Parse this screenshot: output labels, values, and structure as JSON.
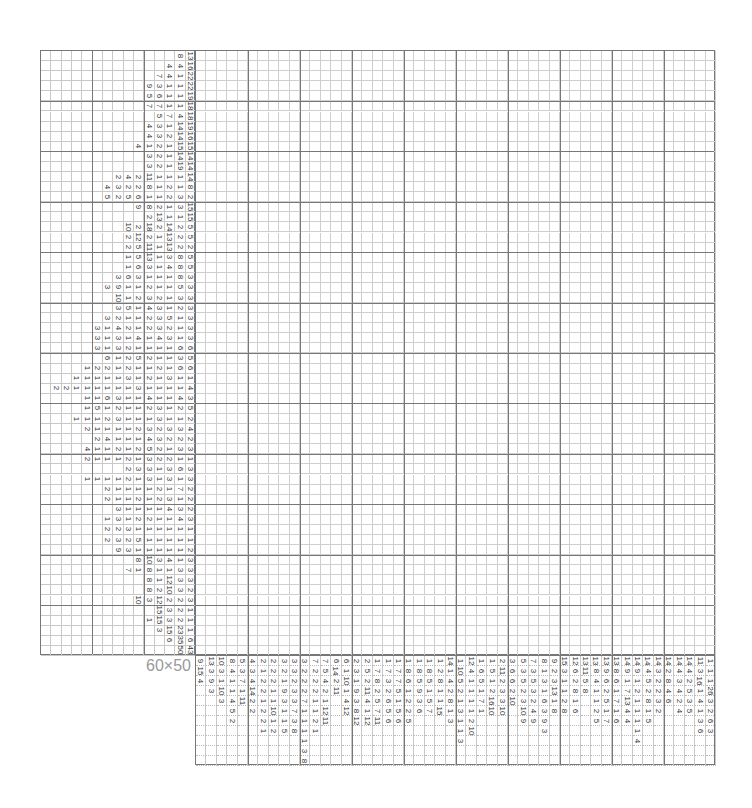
{
  "puzzle": {
    "size_label": "60×50",
    "rows": 60,
    "cols": 50,
    "row_clue_slots": 15,
    "col_clue_slots": 11,
    "thick_every": 5,
    "line_color": "#777777",
    "thin_line_color": "#cfcfcf"
  },
  "row_clues": [
    [
      "8",
      "13"
    ],
    [
      "4",
      "4",
      "16"
    ],
    [
      "7",
      "4",
      "1",
      "22"
    ],
    [
      "9",
      "3",
      "1",
      "1",
      "22"
    ],
    [
      "5",
      "6",
      "1",
      "1",
      "19"
    ],
    [
      "7",
      "7",
      "1",
      "1",
      "18"
    ],
    [
      "5",
      "7",
      "4",
      "18"
    ],
    [
      "4",
      "3",
      "1",
      "14",
      "19"
    ],
    [
      "4",
      "3",
      "2",
      "14",
      "16"
    ],
    [
      "4",
      "1",
      "2",
      "1",
      "15",
      "15"
    ],
    [
      "3",
      "2",
      "1",
      "14",
      "14"
    ],
    [
      "3",
      "2",
      "1",
      "19",
      "14"
    ],
    [
      "2",
      "4",
      "2",
      "11",
      "1",
      "1",
      "1",
      "14"
    ],
    [
      "4",
      "3",
      "2",
      "2",
      "8",
      "1",
      "2",
      "1",
      "8"
    ],
    [
      "5",
      "2",
      "5",
      "6",
      "1",
      "1",
      "2",
      "3",
      "2"
    ],
    [
      "9",
      "8",
      "2",
      "1",
      "3",
      "15"
    ],
    [
      "2",
      "13",
      "1",
      "1",
      "15"
    ],
    [
      "10",
      "2",
      "18",
      "2",
      "14",
      "2",
      "5"
    ],
    [
      "2",
      "12",
      "2",
      "1",
      "13",
      "2",
      "5"
    ],
    [
      "2",
      "5",
      "11",
      "1",
      "13",
      "2",
      "2"
    ],
    [
      "1",
      "5",
      "13",
      "1",
      "3",
      "8",
      "5"
    ],
    [
      "1",
      "6",
      "3",
      "1",
      "4",
      "8",
      "5"
    ],
    [
      "3",
      "6",
      "3",
      "1",
      "1",
      "1",
      "8",
      "3"
    ],
    [
      "3",
      "9",
      "1",
      "1",
      "2",
      "1",
      "1",
      "5",
      "3"
    ],
    [
      "10",
      "1",
      "2",
      "3",
      "2",
      "1",
      "3",
      "3"
    ],
    [
      "3",
      "5",
      "1",
      "4",
      "3",
      "1",
      "2",
      "3"
    ],
    [
      "3",
      "2",
      "1",
      "1",
      "2",
      "3",
      "5",
      "1",
      "3"
    ],
    [
      "3",
      "1",
      "4",
      "2",
      "1",
      "2",
      "3",
      "2",
      "1",
      "3"
    ],
    [
      "3",
      "1",
      "3",
      "1",
      "4",
      "1",
      "4",
      "3",
      "1",
      "3"
    ],
    [
      "3",
      "1",
      "3",
      "2",
      "1",
      "1",
      "1",
      "1",
      "6",
      "6"
    ],
    [
      "6",
      "1",
      "2",
      "5",
      "2",
      "1",
      "1",
      "3",
      "5"
    ],
    [
      "1",
      "2",
      "2",
      "1",
      "2",
      "1",
      "1",
      "2",
      "1",
      "6",
      "6"
    ],
    [
      "1",
      "1",
      "1",
      "1",
      "1",
      "3",
      "1",
      "2",
      "1",
      "3",
      "1",
      "1"
    ],
    [
      "2",
      "2",
      "1",
      "1",
      "1",
      "1",
      "1",
      "1",
      "3",
      "1",
      "1",
      "1",
      "1",
      "4"
    ],
    [
      "1",
      "1",
      "6",
      "3",
      "1",
      "1",
      "4",
      "1",
      "1",
      "4",
      "3"
    ],
    [
      "1",
      "5",
      "1",
      "2",
      "1",
      "1",
      "2",
      "3",
      "1",
      "2",
      "5"
    ],
    [
      "1",
      "1",
      "1",
      "2",
      "3",
      "1",
      "1",
      "1",
      "3",
      "1",
      "1",
      "2"
    ],
    [
      "2",
      "1",
      "1",
      "1",
      "1",
      "2",
      "3",
      "2",
      "3",
      "3",
      "4"
    ],
    [
      "2",
      "4",
      "1",
      "1",
      "1",
      "4",
      "3",
      "2",
      "2",
      "2"
    ],
    [
      "4",
      "1",
      "1",
      "2",
      "1",
      "2",
      "5",
      "2",
      "1",
      "3",
      "3"
    ],
    [
      "2",
      "1",
      "1",
      "1",
      "2",
      "1",
      "3",
      "2",
      "2",
      "1",
      "1"
    ],
    [
      "2",
      "3",
      "3",
      "1",
      "3",
      "6",
      "3"
    ],
    [
      "1",
      "1",
      "1",
      "1",
      "2",
      "1",
      "3",
      "1",
      "3",
      "1",
      "3"
    ],
    [
      "2",
      "1",
      "1",
      "1",
      "1",
      "2",
      "1",
      "7",
      "2"
    ],
    [
      "2",
      "1",
      "1",
      "2",
      "1",
      "2",
      "3",
      "1",
      "2"
    ],
    [
      "3",
      "1",
      "1",
      "1",
      "1",
      "4",
      "3",
      "2"
    ],
    [
      "1",
      "3",
      "1",
      "2",
      "2",
      "1",
      "1",
      "4",
      "3"
    ],
    [
      "2",
      "2",
      "3",
      "1",
      "1",
      "1",
      "1",
      "1",
      "1"
    ],
    [
      "2",
      "3",
      "2",
      "5",
      "1",
      "1",
      "1",
      "1",
      "1"
    ],
    [
      "9",
      "3",
      "1",
      "1",
      "1",
      "1",
      "1",
      "2"
    ],
    [
      "8",
      "10",
      "3",
      "4",
      "1",
      "3"
    ],
    [
      "7",
      "1",
      "8",
      "1",
      "1",
      "3",
      "3"
    ],
    [
      "8",
      "1",
      "12",
      "3",
      "3"
    ],
    [
      "8",
      "2",
      "10",
      "3",
      "2"
    ],
    [
      "10",
      "3",
      "12",
      "2",
      "2",
      "3"
    ],
    [
      "15",
      "3",
      "2",
      "1"
    ],
    [
      "1",
      "15",
      "3",
      "2",
      "1"
    ],
    [
      "3",
      "15",
      "23",
      "1"
    ],
    [
      "6",
      "35",
      "6"
    ],
    [
      "50",
      "43"
    ]
  ],
  "col_clues": [
    [
      "9",
      "15",
      "4"
    ],
    [
      "13",
      "3",
      "9",
      "3"
    ],
    [
      "10",
      "3",
      "1",
      "10",
      "3"
    ],
    [
      "8",
      "4",
      "1",
      "1",
      "4",
      "5",
      "2"
    ],
    [
      "5",
      "3",
      "7",
      "1",
      "11"
    ],
    [
      "4",
      "3",
      "4",
      "14",
      "2",
      "2"
    ],
    [
      "2",
      "1",
      "2",
      "2",
      "1",
      "2",
      "2",
      "1"
    ],
    [
      "2",
      "2",
      "2",
      "1",
      "1",
      "10",
      "1",
      "2"
    ],
    [
      "3",
      "2",
      "1",
      "9",
      "3",
      "1",
      "1",
      "5"
    ],
    [
      "3",
      "3",
      "2",
      "3",
      "3",
      "7",
      "3",
      "8"
    ],
    [
      "3",
      "2",
      "2",
      "2",
      "7",
      "1",
      "1",
      "1",
      "1",
      "3",
      "8"
    ],
    [
      "7",
      "2",
      "2",
      "2",
      "1",
      "1",
      "2",
      "1"
    ],
    [
      "7",
      "5",
      "4",
      "2",
      "1",
      "12",
      "11"
    ],
    [
      "6",
      "14",
      "2",
      "11"
    ],
    [
      "6",
      "1",
      "10",
      "1",
      "4",
      "12"
    ],
    [
      "2",
      "3",
      "1",
      "9",
      "3",
      "8",
      "12"
    ],
    [
      "2",
      "5",
      "2",
      "11",
      "4",
      "1",
      "12"
    ],
    [
      "1",
      "7",
      "8",
      "2",
      "5",
      "7",
      "11"
    ],
    [
      "1",
      "7",
      "3",
      "2",
      "6",
      "5",
      "6"
    ],
    [
      "1",
      "7",
      "7",
      "5",
      "1",
      "5",
      "6"
    ],
    [
      "1",
      "8",
      "6",
      "1",
      "2",
      "2",
      "5"
    ],
    [
      "1",
      "8",
      "5",
      "9",
      "3",
      "6"
    ],
    [
      "1",
      "8",
      "5",
      "1",
      "5",
      "7"
    ],
    [
      "1",
      "2",
      "8",
      "1",
      "1",
      "15"
    ],
    [
      "14",
      "1",
      "4",
      "2",
      "8",
      "1",
      "3"
    ],
    [
      "1",
      "10",
      "5",
      "2",
      "1",
      "3",
      "1",
      "1",
      "3"
    ],
    [
      "12",
      "4",
      "1",
      "1",
      "1",
      "1",
      "2",
      "10"
    ],
    [
      "1",
      "6",
      "5",
      "1",
      "7",
      "1"
    ],
    [
      "1",
      "5",
      "1",
      "2",
      "16",
      "10"
    ],
    [
      "2",
      "11",
      "2",
      "3",
      "3",
      "10"
    ],
    [
      "3",
      "6",
      "6",
      "2",
      "10"
    ],
    [
      "5",
      "3",
      "5",
      "2",
      "3",
      "10",
      "9"
    ],
    [
      "7",
      "3",
      "5",
      "3",
      "2",
      "4",
      "9"
    ],
    [
      "8",
      "1",
      "3",
      "1",
      "6",
      "3",
      "9",
      "3"
    ],
    [
      "9",
      "2",
      "3",
      "13",
      "1",
      "8"
    ],
    [
      "15",
      "3",
      "1",
      "1",
      "2",
      "8"
    ],
    [
      "12",
      "6",
      "2",
      "8",
      "1",
      "6"
    ],
    [
      "13",
      "11",
      "5",
      "8"
    ],
    [
      "13",
      "8",
      "4",
      "1",
      "1",
      "2",
      "5"
    ],
    [
      "13",
      "9",
      "6",
      "2",
      "5",
      "1",
      "7"
    ],
    [
      "13",
      "8",
      "6",
      "1",
      "7",
      "1",
      "6"
    ],
    [
      "14",
      "9",
      "1",
      "7",
      "13",
      "4",
      "4"
    ],
    [
      "14",
      "9",
      "1",
      "2",
      "1",
      "1",
      "1",
      "1",
      "4"
    ],
    [
      "14",
      "4",
      "5",
      "2",
      "8",
      "1",
      "5"
    ],
    [
      "14",
      "3",
      "2",
      "2",
      "3",
      "2"
    ],
    [
      "14",
      "2",
      "8",
      "4",
      "6"
    ],
    [
      "14",
      "4",
      "3",
      "4",
      "2",
      "4"
    ],
    [
      "14",
      "4",
      "2",
      "5",
      "3",
      "5"
    ],
    [
      "11",
      "3",
      "16",
      "1",
      "4",
      "1",
      "3",
      "6"
    ],
    [
      "1",
      "1",
      "1",
      "26",
      "3",
      "2",
      "6",
      "3"
    ],
    [
      "1",
      "1",
      "46"
    ]
  ]
}
